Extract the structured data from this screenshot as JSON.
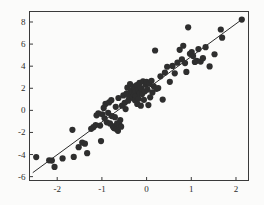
{
  "chart_data": {
    "type": "scatter",
    "title": "",
    "subtitle": "",
    "xlabel": "",
    "ylabel": "",
    "xlim": [
      -2.62,
      2.28
    ],
    "ylim": [
      -6.35,
      8.95
    ],
    "xticks": [
      -2,
      -1,
      0,
      1,
      2
    ],
    "xtick_labels": [
      "-2",
      "-1",
      "0",
      "1",
      "2"
    ],
    "yticks": [
      8,
      6,
      4,
      2,
      0,
      -2,
      -4,
      -6
    ],
    "ytick_labels": [
      "8",
      "6",
      "4",
      "2",
      "0",
      "-2",
      "-4",
      "-6"
    ],
    "grid": false,
    "legend": null,
    "frame": true,
    "marker": {
      "shape": "circle",
      "color": "#2e2e2e",
      "size": 3.1
    },
    "fit_line": {
      "type": "linear-regression",
      "color": "#2b2b2b",
      "width": 1,
      "x_start": -2.54,
      "y_start": -5.62,
      "x_end": 2.14,
      "y_end": 8.25,
      "slope": 2.97,
      "intercept": 1.93
    },
    "n_points": 104,
    "points": [
      [
        -2.47,
        -4.23
      ],
      [
        -2.18,
        -4.52
      ],
      [
        -2.12,
        -4.55
      ],
      [
        -2.06,
        -5.12
      ],
      [
        -1.88,
        -4.35
      ],
      [
        -1.66,
        -1.76
      ],
      [
        -1.63,
        -4.22
      ],
      [
        -1.52,
        -3.33
      ],
      [
        -1.44,
        -2.92
      ],
      [
        -1.38,
        -3.02
      ],
      [
        -1.33,
        -3.88
      ],
      [
        -1.24,
        -1.67
      ],
      [
        -1.19,
        -1.52
      ],
      [
        -1.14,
        -1.33
      ],
      [
        -1.12,
        -0.45
      ],
      [
        -1.08,
        -0.28
      ],
      [
        -1.04,
        -1.38
      ],
      [
        -1.02,
        -2.78
      ],
      [
        -0.99,
        -0.35
      ],
      [
        -0.96,
        0.22
      ],
      [
        -0.94,
        -0.72
      ],
      [
        -0.92,
        0.58
      ],
      [
        -0.89,
        -1.08
      ],
      [
        -0.86,
        -0.22
      ],
      [
        -0.84,
        0.72
      ],
      [
        -0.82,
        -1.18
      ],
      [
        -0.79,
        0.92
      ],
      [
        -0.78,
        -0.52
      ],
      [
        -0.76,
        -1.42
      ],
      [
        -0.74,
        -1.55
      ],
      [
        -0.72,
        -1.62
      ],
      [
        -0.71,
        -0.62
      ],
      [
        -0.69,
        0.32
      ],
      [
        -0.67,
        -1.72
      ],
      [
        -0.66,
        -1.18
      ],
      [
        -0.64,
        -1.85
      ],
      [
        -0.63,
        1.12
      ],
      [
        -0.61,
        -1.28
      ],
      [
        -0.59,
        -0.88
      ],
      [
        -0.57,
        -1.48
      ],
      [
        -0.55,
        0.42
      ],
      [
        -0.52,
        1.35
      ],
      [
        -0.49,
        0.68
      ],
      [
        -0.47,
        0.12
      ],
      [
        -0.45,
        1.52
      ],
      [
        -0.43,
        2.05
      ],
      [
        -0.41,
        0.88
      ],
      [
        -0.39,
        1.22
      ],
      [
        -0.37,
        2.38
      ],
      [
        -0.35,
        1.78
      ],
      [
        -0.34,
        1.38
      ],
      [
        -0.32,
        1.62
      ],
      [
        -0.31,
        1.18
      ],
      [
        -0.3,
        2.15
      ],
      [
        -0.28,
        1.45
      ],
      [
        -0.27,
        1.92
      ],
      [
        -0.26,
        0.92
      ],
      [
        -0.25,
        1.68
      ],
      [
        -0.24,
        1.28
      ],
      [
        -0.22,
        2.28
      ],
      [
        -0.21,
        0.58
      ],
      [
        -0.19,
        1.82
      ],
      [
        -0.18,
        1.05
      ],
      [
        -0.16,
        2.48
      ],
      [
        -0.15,
        1.58
      ],
      [
        -0.13,
        0.42
      ],
      [
        -0.12,
        2.02
      ],
      [
        -0.1,
        1.48
      ],
      [
        -0.08,
        2.62
      ],
      [
        -0.06,
        0.95
      ],
      [
        -0.04,
        1.72
      ],
      [
        -0.02,
        2.32
      ],
      [
        0.0,
        2.58
      ],
      [
        0.02,
        1.88
      ],
      [
        0.04,
        0.48
      ],
      [
        0.06,
        2.42
      ],
      [
        0.08,
        1.18
      ],
      [
        0.11,
        2.68
      ],
      [
        0.13,
        1.62
      ],
      [
        0.16,
        2.18
      ],
      [
        0.19,
        5.42
      ],
      [
        0.22,
        1.95
      ],
      [
        0.26,
        2.02
      ],
      [
        0.31,
        3.08
      ],
      [
        0.36,
        0.98
      ],
      [
        0.41,
        3.42
      ],
      [
        0.46,
        3.95
      ],
      [
        0.52,
        2.58
      ],
      [
        0.58,
        4.02
      ],
      [
        0.63,
        3.35
      ],
      [
        0.69,
        4.32
      ],
      [
        0.74,
        5.48
      ],
      [
        0.79,
        4.62
      ],
      [
        0.82,
        5.85
      ],
      [
        0.86,
        4.28
      ],
      [
        0.89,
        3.48
      ],
      [
        0.93,
        7.52
      ],
      [
        0.97,
        5.12
      ],
      [
        1.01,
        5.28
      ],
      [
        1.04,
        4.92
      ],
      [
        1.08,
        4.38
      ],
      [
        1.12,
        4.48
      ],
      [
        1.16,
        5.55
      ],
      [
        1.21,
        4.42
      ],
      [
        1.26,
        4.72
      ],
      [
        1.32,
        5.72
      ],
      [
        1.41,
        3.98
      ],
      [
        1.52,
        5.08
      ],
      [
        1.66,
        7.32
      ],
      [
        1.69,
        6.58
      ],
      [
        2.13,
        8.22
      ]
    ]
  }
}
